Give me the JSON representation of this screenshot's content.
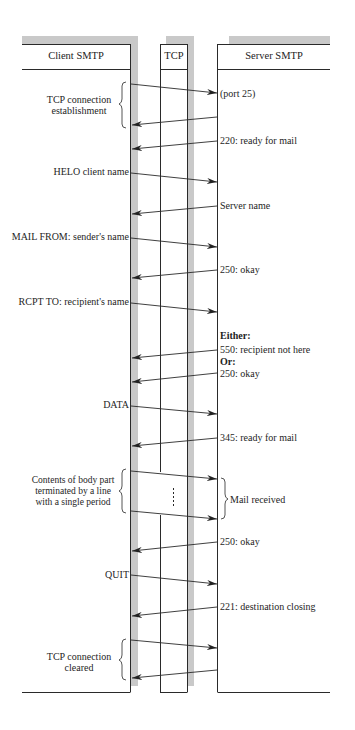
{
  "headers": {
    "client": "Client SMTP",
    "tcp": "TCP",
    "server": "Server SMTP"
  },
  "client_labels": {
    "tcp_establish": [
      "TCP connection",
      "establishment"
    ],
    "helo": "HELO client name",
    "mail_from": "MAIL FROM: sender's name",
    "rcpt_to": "RCPT TO: recipient's name",
    "data": "DATA",
    "body": [
      "Contents of body part",
      "terminated by a line",
      "with a single period"
    ],
    "quit": "QUIT",
    "tcp_cleared": [
      "TCP connection",
      "cleared"
    ]
  },
  "server_labels": {
    "port": "(port 25)",
    "ready_220": "220: ready for mail",
    "server_name": "Server name",
    "okay_250_a": "250: okay",
    "either": "Either:",
    "not_here_550": "550: recipient not here",
    "or": "Or:",
    "okay_250_b": "250: okay",
    "ready_345": "345: ready for mail",
    "mail_received": "Mail received",
    "okay_250_c": "250: okay",
    "closing_221": "221: destination closing"
  },
  "colors": {
    "line": "#2a2a2a",
    "shadow": "#c8c8c8"
  }
}
